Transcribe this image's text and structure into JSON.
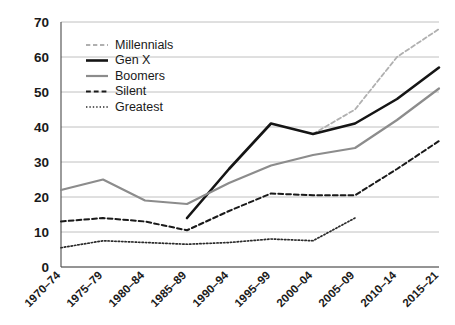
{
  "chart_data": {
    "type": "line",
    "title": "",
    "subtitle": "",
    "xlabel": "",
    "ylabel": "",
    "grid": true,
    "legend_position": "top-left",
    "ylim": [
      0,
      70
    ],
    "yticks": [
      0,
      10,
      20,
      30,
      40,
      50,
      60,
      70
    ],
    "ytick_labels": [
      "0",
      "10",
      "20",
      "30",
      "40",
      "50",
      "60",
      "70"
    ],
    "categories": [
      "1970–74",
      "1975–79",
      "1980–84",
      "1985–89",
      "1990–94",
      "1995–99",
      "2000–04",
      "2005–09",
      "2010–14",
      "2015–21"
    ],
    "series": [
      {
        "name": "Millennials",
        "color": "#b0b0b0",
        "style": "dashed",
        "width": 1.8,
        "values": [
          null,
          null,
          null,
          null,
          null,
          null,
          38,
          45,
          60,
          68
        ]
      },
      {
        "name": "Gen X",
        "color": "#151515",
        "style": "solid",
        "width": 2.6,
        "values": [
          null,
          null,
          null,
          14,
          28,
          41,
          38,
          41,
          48,
          57
        ]
      },
      {
        "name": "Boomers",
        "color": "#8c8c8c",
        "style": "solid",
        "width": 2.2,
        "values": [
          22,
          25,
          19,
          18,
          24,
          29,
          32,
          34,
          42,
          51
        ]
      },
      {
        "name": "Silent",
        "color": "#1a1a1a",
        "style": "dashed",
        "width": 2.0,
        "values": [
          13,
          14,
          13,
          10.5,
          16,
          21,
          20.5,
          20.5,
          28,
          36
        ]
      },
      {
        "name": "Greatest",
        "color": "#2b2b2b",
        "style": "dotted",
        "width": 1.7,
        "values": [
          5.5,
          7.5,
          7,
          6.5,
          7,
          8,
          7.5,
          14,
          null,
          null
        ]
      }
    ]
  },
  "legend": {
    "items": [
      {
        "label": "Millennials"
      },
      {
        "label": "Gen X"
      },
      {
        "label": "Boomers"
      },
      {
        "label": "Silent"
      },
      {
        "label": "Greatest"
      }
    ]
  }
}
